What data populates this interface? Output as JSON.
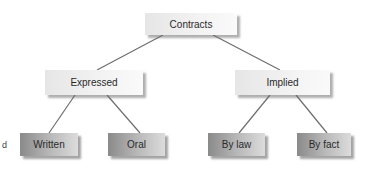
{
  "diagram": {
    "type": "tree",
    "root": {
      "label": "Contracts",
      "children": [
        {
          "label": "Expressed",
          "children": [
            {
              "label": "Written"
            },
            {
              "label": "Oral"
            }
          ]
        },
        {
          "label": "Implied",
          "children": [
            {
              "label": "By law"
            },
            {
              "label": "By fact"
            }
          ]
        }
      ]
    },
    "cropped_text_left": "d",
    "colors": {
      "line": "#6e6e6e",
      "light_box": "#f0f0f0",
      "dark_box": "#a8a8a8",
      "text": "#2a2a2a"
    }
  }
}
